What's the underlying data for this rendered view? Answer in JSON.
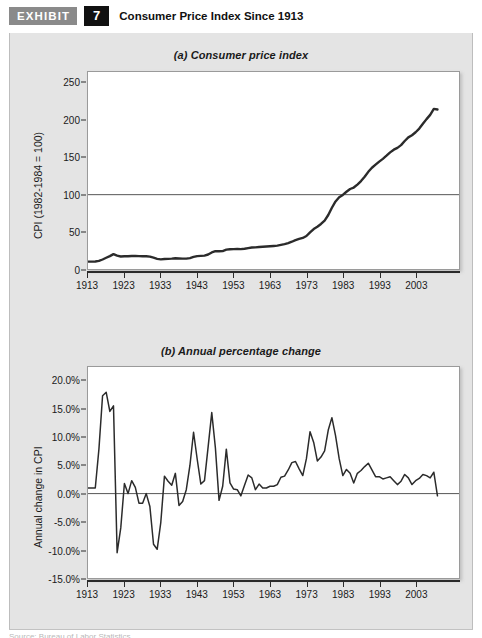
{
  "header": {
    "tag": "EXHIBIT",
    "number": "7",
    "title": "Consumer Price Index Since 1913"
  },
  "footer": {
    "cut_text": "Source: Bureau of Labor Statistics"
  },
  "colors": {
    "panel_background": "#e4e4e4",
    "plot_background": "#ffffff",
    "line": "#2b2b2b",
    "reference_line": "#555555",
    "frame": "#9a9a9a",
    "tag_background": "#8a8a8a",
    "number_background": "#111111",
    "text": "#1a1a1a"
  },
  "chart_data": [
    {
      "type": "line",
      "id": "consumer-price-index",
      "title": "(a) Consumer price index",
      "xlabel": "",
      "ylabel": "CPI (1982-1984 = 100)",
      "xlim": [
        1913,
        2010
      ],
      "ylim": [
        0,
        265
      ],
      "yticks": [
        0,
        50,
        100,
        150,
        200,
        250
      ],
      "ytick_labels": [
        "0",
        "50",
        "100",
        "150",
        "200",
        "250"
      ],
      "xticks": [
        1913,
        1923,
        1933,
        1943,
        1953,
        1963,
        1973,
        1983,
        1993,
        2003
      ],
      "xtick_labels": [
        "1913",
        "1923",
        "1933",
        "1943",
        "1953",
        "1963",
        "1973",
        "1983",
        "1993",
        "2003"
      ],
      "grid": false,
      "legend": "none",
      "reference_lines": [
        {
          "y": 100,
          "label": "100"
        }
      ],
      "x": [
        1913,
        1914,
        1915,
        1916,
        1917,
        1918,
        1919,
        1920,
        1921,
        1922,
        1923,
        1924,
        1925,
        1926,
        1927,
        1928,
        1929,
        1930,
        1931,
        1932,
        1933,
        1934,
        1935,
        1936,
        1937,
        1938,
        1939,
        1940,
        1941,
        1942,
        1943,
        1944,
        1945,
        1946,
        1947,
        1948,
        1949,
        1950,
        1951,
        1952,
        1953,
        1954,
        1955,
        1956,
        1957,
        1958,
        1959,
        1960,
        1961,
        1962,
        1963,
        1964,
        1965,
        1966,
        1967,
        1968,
        1969,
        1970,
        1971,
        1972,
        1973,
        1974,
        1975,
        1976,
        1977,
        1978,
        1979,
        1980,
        1981,
        1982,
        1983,
        1984,
        1985,
        1986,
        1987,
        1988,
        1989,
        1990,
        1991,
        1992,
        1993,
        1994,
        1995,
        1996,
        1997,
        1998,
        1999,
        2000,
        2001,
        2002,
        2003,
        2004,
        2005,
        2006,
        2007,
        2008,
        2009
      ],
      "values": [
        9.9,
        10.0,
        10.1,
        10.9,
        12.8,
        15.1,
        17.3,
        20.0,
        17.9,
        16.8,
        17.1,
        17.1,
        17.5,
        17.7,
        17.4,
        17.1,
        17.1,
        16.7,
        15.2,
        13.7,
        13.0,
        13.4,
        13.7,
        13.9,
        14.4,
        14.1,
        13.9,
        14.0,
        14.7,
        16.3,
        17.3,
        17.6,
        18.0,
        19.5,
        22.3,
        24.1,
        23.8,
        24.1,
        26.0,
        26.5,
        26.7,
        26.9,
        26.8,
        27.2,
        28.1,
        28.9,
        29.1,
        29.6,
        29.9,
        30.2,
        30.6,
        31.0,
        31.5,
        32.4,
        33.4,
        34.8,
        36.7,
        38.8,
        40.5,
        41.8,
        44.4,
        49.3,
        53.8,
        56.9,
        60.6,
        65.2,
        72.6,
        82.4,
        90.9,
        96.5,
        99.6,
        103.9,
        107.6,
        109.6,
        113.6,
        118.3,
        124.0,
        130.7,
        136.2,
        140.3,
        144.5,
        148.2,
        152.4,
        156.9,
        160.5,
        163.0,
        166.6,
        172.2,
        177.1,
        179.9,
        184.0,
        188.9,
        195.3,
        201.6,
        207.3,
        215.3,
        214.5
      ]
    },
    {
      "type": "line",
      "id": "annual-percentage-change",
      "title": "(b) Annual percentage change",
      "xlabel": "",
      "ylabel": "Annual change in CPI",
      "xlim": [
        1913,
        2010
      ],
      "ylim": [
        -15.0,
        22.5
      ],
      "yticks": [
        -15.0,
        -10.0,
        -5.0,
        0.0,
        5.0,
        10.0,
        15.0,
        20.0
      ],
      "ytick_labels": [
        "-15.0%",
        "-10.0%",
        "-5.0%",
        "0.0%",
        "5.0%",
        "10.0%",
        "15.0%",
        "20.0%"
      ],
      "xticks": [
        1913,
        1923,
        1933,
        1943,
        1953,
        1963,
        1973,
        1983,
        1993,
        2003
      ],
      "xtick_labels": [
        "1913",
        "1923",
        "1933",
        "1943",
        "1953",
        "1963",
        "1973",
        "1983",
        "1993",
        "2003"
      ],
      "grid": false,
      "legend": "none",
      "reference_lines": [
        {
          "y": 0,
          "label": "0.0%"
        }
      ],
      "x": [
        1913,
        1914,
        1915,
        1916,
        1917,
        1918,
        1919,
        1920,
        1921,
        1922,
        1923,
        1924,
        1925,
        1926,
        1927,
        1928,
        1929,
        1930,
        1931,
        1932,
        1933,
        1934,
        1935,
        1936,
        1937,
        1938,
        1939,
        1940,
        1941,
        1942,
        1943,
        1944,
        1945,
        1946,
        1947,
        1948,
        1949,
        1950,
        1951,
        1952,
        1953,
        1954,
        1955,
        1956,
        1957,
        1958,
        1959,
        1960,
        1961,
        1962,
        1963,
        1964,
        1965,
        1966,
        1967,
        1968,
        1969,
        1970,
        1971,
        1972,
        1973,
        1974,
        1975,
        1976,
        1977,
        1978,
        1979,
        1980,
        1981,
        1982,
        1983,
        1984,
        1985,
        1986,
        1987,
        1988,
        1989,
        1990,
        1991,
        1992,
        1993,
        1994,
        1995,
        1996,
        1997,
        1998,
        1999,
        2000,
        2001,
        2002,
        2003,
        2004,
        2005,
        2006,
        2007,
        2008,
        2009
      ],
      "values": [
        1.0,
        1.0,
        1.0,
        7.9,
        17.4,
        18.0,
        14.6,
        15.6,
        -10.5,
        -6.1,
        1.8,
        0.0,
        2.3,
        1.1,
        -1.7,
        -1.7,
        0.0,
        -2.3,
        -9.0,
        -9.9,
        -5.1,
        3.1,
        2.2,
        1.5,
        3.6,
        -2.1,
        -1.4,
        0.7,
        5.0,
        10.9,
        6.1,
        1.7,
        2.3,
        8.3,
        14.4,
        8.1,
        -1.2,
        1.3,
        7.9,
        1.9,
        0.8,
        0.7,
        -0.4,
        1.5,
        3.3,
        2.8,
        0.7,
        1.7,
        1.0,
        1.0,
        1.3,
        1.3,
        1.6,
        2.9,
        3.1,
        4.2,
        5.5,
        5.7,
        4.4,
        3.2,
        6.2,
        11.0,
        9.1,
        5.8,
        6.5,
        7.6,
        11.3,
        13.5,
        10.3,
        6.2,
        3.2,
        4.3,
        3.6,
        1.9,
        3.6,
        4.1,
        4.8,
        5.4,
        4.2,
        3.0,
        3.0,
        2.6,
        2.8,
        3.0,
        2.3,
        1.6,
        2.2,
        3.4,
        2.8,
        1.6,
        2.3,
        2.7,
        3.4,
        3.2,
        2.8,
        3.8,
        -0.4
      ]
    }
  ]
}
